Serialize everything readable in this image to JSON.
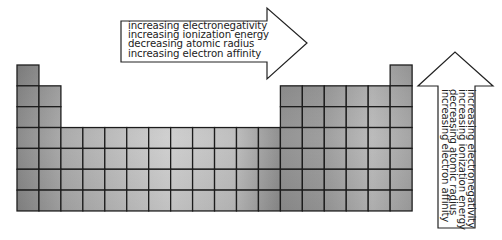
{
  "diagram": {
    "table": {
      "columns": 18,
      "rows": 7,
      "cell_width": 21.95,
      "cell_height": 20.85,
      "shape_rows": [
        [
          1,
          18
        ],
        [
          1,
          2,
          13,
          14,
          15,
          16,
          17,
          18
        ],
        [
          1,
          2,
          13,
          14,
          15,
          16,
          17,
          18
        ],
        [
          1,
          2,
          3,
          4,
          5,
          6,
          7,
          8,
          9,
          10,
          11,
          12,
          13,
          14,
          15,
          16,
          17,
          18
        ],
        [
          1,
          2,
          3,
          4,
          5,
          6,
          7,
          8,
          9,
          10,
          11,
          12,
          13,
          14,
          15,
          16,
          17,
          18
        ],
        [
          1,
          2,
          3,
          4,
          5,
          6,
          7,
          8,
          9,
          10,
          11,
          12,
          13,
          14,
          15,
          16,
          17,
          18
        ],
        [
          1,
          2,
          3,
          4,
          5,
          6,
          7,
          8,
          9,
          10,
          11,
          12,
          13,
          14,
          15,
          16,
          17,
          18
        ]
      ],
      "border_color": "#1c1c1c",
      "fill_gradient": [
        "#858585",
        "#a8a8a8",
        "#cdcdcd",
        "#bcbcbc",
        "#8e8e8e",
        "#9a9a9a",
        "#b8b8b8",
        "#a0a0a0"
      ]
    },
    "arrow_right": {
      "direction": "right",
      "label": "across a period",
      "lines": [
        "increasing electronegativity",
        "increasing ionization energy",
        "decreasing atomic radius",
        "increasing electron affinity"
      ]
    },
    "arrow_up": {
      "direction": "up",
      "label": "up a group",
      "lines": [
        "increasing electronegativity",
        "increasing ionization energy",
        "decreasing atomic radius",
        "increasing electron affinity"
      ]
    }
  }
}
